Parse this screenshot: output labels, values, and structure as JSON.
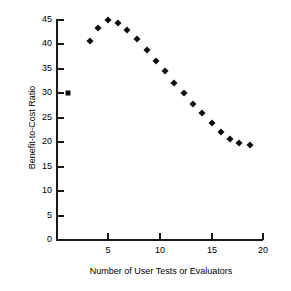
{
  "chart_data": {
    "type": "scatter",
    "title": "",
    "xlabel": "Number of User Tests or Evaluators",
    "ylabel": "Benefit-to-Cost Ratio",
    "xlim": [
      0,
      20
    ],
    "ylim": [
      0,
      45
    ],
    "xticks": [
      5,
      10,
      15,
      20
    ],
    "yticks": [
      0,
      5,
      10,
      15,
      20,
      25,
      30,
      35,
      40,
      45
    ],
    "xtick_labels": [
      "5",
      "10",
      "15",
      "20"
    ],
    "ytick_labels": [
      "0",
      "5",
      "10",
      "15",
      "20",
      "25",
      "30",
      "35",
      "40",
      "45"
    ],
    "grid": false,
    "legend": false,
    "marker_color": "#0d0d0d",
    "series": [
      {
        "name": "Single test or evaluator",
        "marker": "square",
        "x": [
          1.2
        ],
        "y": [
          30.0
        ]
      },
      {
        "name": "Benefit-to-cost ratio curve",
        "marker": "diamond",
        "x": [
          3.3,
          4.1,
          5.0,
          6.0,
          6.9,
          7.9,
          8.8,
          9.7,
          10.6,
          11.5,
          12.4,
          13.3,
          14.2,
          15.1,
          16.0,
          16.9,
          17.8,
          18.8
        ],
        "y": [
          40.8,
          43.4,
          44.9,
          44.4,
          43.0,
          41.1,
          38.9,
          36.7,
          34.5,
          32.2,
          30.1,
          27.9,
          25.9,
          23.9,
          22.1,
          20.6,
          19.8,
          19.4
        ]
      }
    ]
  }
}
